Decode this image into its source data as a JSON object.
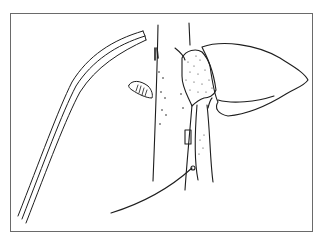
{
  "figure": {
    "type": "anatomical-sketch",
    "colors": {
      "background": "#ffffff",
      "frame_border": "#6a6a6a",
      "ink": "#1e1e1e"
    },
    "elements": [
      {
        "name": "curved-tube",
        "label": ""
      },
      {
        "name": "vessel-left",
        "label": ""
      },
      {
        "name": "vessel-right",
        "label": ""
      },
      {
        "name": "lozenge-object",
        "label": ""
      },
      {
        "name": "stippled-body",
        "label": ""
      },
      {
        "name": "large-lobe",
        "label": ""
      },
      {
        "name": "suture-line",
        "label": ""
      }
    ]
  }
}
